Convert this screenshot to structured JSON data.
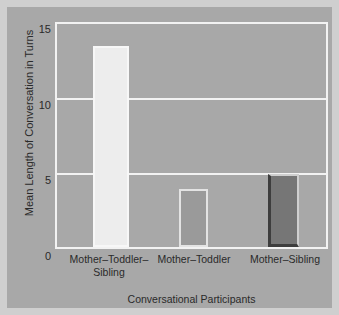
{
  "chart_data": {
    "type": "bar",
    "title": "",
    "xlabel": "Conversational Participants",
    "ylabel": "Mean Length of Conversation in Turns",
    "categories": [
      "Mother–Toddler–Sibling",
      "Mother–Toddler",
      "Mother–Sibling"
    ],
    "category_lines": [
      [
        "Mother–Toddler–",
        "Sibling"
      ],
      [
        "Mother–Toddler"
      ],
      [
        "Mother–Sibling"
      ]
    ],
    "values": [
      13.5,
      3.9,
      4.9
    ],
    "ylim": [
      0,
      15
    ],
    "yticks": [
      0,
      5,
      10,
      15
    ],
    "ytick_labels": [
      "0",
      "5",
      "10",
      "15"
    ],
    "grid": true,
    "grid_axis": "y",
    "legend": "none",
    "bar_colors": [
      "#ededed",
      "#9a9a9a",
      "#767676"
    ],
    "bar_edge_colors": [
      "#f7f7f7",
      "#e3e3e3",
      "#3d3d3d"
    ],
    "plot_background": "#a8a8a8",
    "figure_background": "#a8a8a8",
    "border_color": "#cfcfcf",
    "axis_color": "#f2f2f2",
    "text_color": "#2a2a2a"
  },
  "figure": {
    "width": 339,
    "height": 315
  }
}
